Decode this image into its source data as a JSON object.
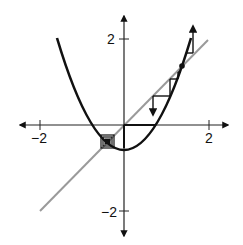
{
  "diagram": {
    "type": "cobweb-plot",
    "function": "f(x) = x^2 - 0.55",
    "colors": {
      "curve": "#111111",
      "diagonal": "#999999",
      "axes": "#222222",
      "cobweb": "#111111"
    },
    "axes": {
      "x_ticks": [
        {
          "value": -2,
          "label": "−2"
        },
        {
          "value": 2,
          "label": "2"
        }
      ],
      "y_ticks": [
        {
          "value": 2,
          "label": "2"
        },
        {
          "value": -2,
          "label": "−2"
        }
      ]
    },
    "labels": {
      "x_neg2": "−2",
      "x_pos2": "2",
      "y_pos2": "2",
      "y_neg2": "−2"
    },
    "fixed_points": [
      {
        "x": -0.39,
        "y": -0.39,
        "kind": "attracting (nested squares)"
      },
      {
        "x": 1.39,
        "y": 1.39,
        "kind": "repelling (dot)"
      }
    ]
  }
}
